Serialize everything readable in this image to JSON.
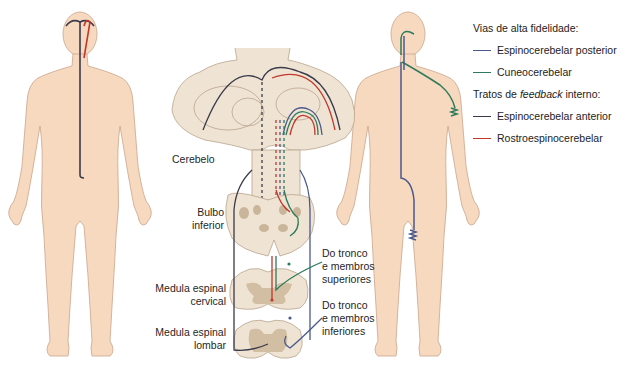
{
  "legend": {
    "group1_title": "Vias de alta fidelidade:",
    "group1_items": [
      {
        "label": "Espinocerebelar posterior",
        "color": "#4a5a8c"
      },
      {
        "label": "Cuneocerebelar",
        "color": "#2e7a5a"
      }
    ],
    "group2_title_prefix": "Tratos de ",
    "group2_title_em": "feedback",
    "group2_title_suffix": " interno:",
    "group2_items": [
      {
        "label": "Espinocerebelar anterior",
        "color": "#3a3a4a"
      },
      {
        "label": "Rostroespinocerebelar",
        "color": "#c0392b"
      }
    ]
  },
  "labels": {
    "cerebelo": "Cerebelo",
    "bulbo_1": "Bulbo",
    "bulbo_2": "inferior",
    "cervical_1": "Medula espinal",
    "cervical_2": "cervical",
    "lombar_1": "Medula espinal",
    "lombar_2": "lombar",
    "sup_1": "Do tronco",
    "sup_2": "e membros",
    "sup_3": "superiores",
    "inf_1": "Do tronco",
    "inf_2": "e membros",
    "inf_3": "inferiores"
  },
  "colors": {
    "skin": "#f7d9c0",
    "skin_outline": "#c9a58a",
    "tissue": "#efe3d3",
    "tissue_outline": "#b9a48e",
    "gray_matter": "#d2bea3",
    "posterior": "#4a5a8c",
    "cuneo": "#2e7a5a",
    "anterior": "#3a3a4a",
    "rostro": "#c0392b"
  }
}
